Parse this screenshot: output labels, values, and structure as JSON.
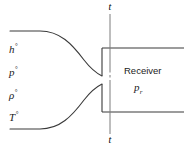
{
  "figure": {
    "line_color": "#3a3a3a",
    "text_color": "#1b1b1b",
    "background": "#ffffff"
  },
  "inlet_labels": [
    {
      "symbol": "h",
      "superscript": "°"
    },
    {
      "symbol": "p",
      "superscript": "°"
    },
    {
      "symbol": "ρ",
      "superscript": "°"
    },
    {
      "symbol": "T",
      "superscript": "°"
    }
  ],
  "throat": {
    "label_top": "t",
    "label_bottom": "t"
  },
  "receiver": {
    "name": "Receiver",
    "pressure_symbol": "p",
    "pressure_subscript": "r"
  }
}
